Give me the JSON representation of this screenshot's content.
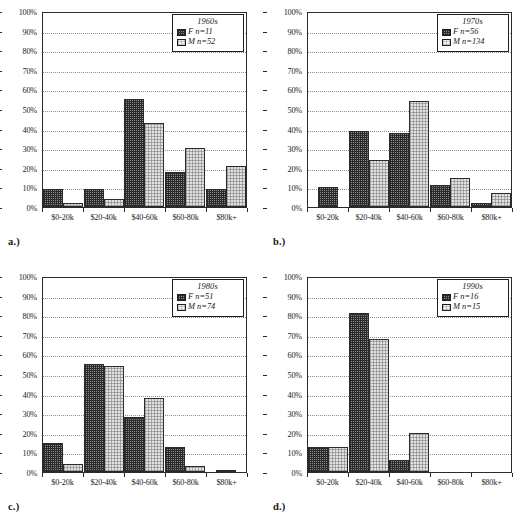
{
  "figure": {
    "panel_count": 4,
    "axis": {
      "y_ticks": [
        "100%",
        "90%",
        "80%",
        "70%",
        "60%",
        "50%",
        "40%",
        "30%",
        "20%",
        "10%",
        "0%"
      ],
      "y_min": 0,
      "y_max": 100,
      "y_step": 10,
      "categories": [
        "$0-20k",
        "$20-40k",
        "$40-60k",
        "$60-80k",
        "$80k+"
      ],
      "grid": true
    },
    "series_keys": [
      "F",
      "M"
    ],
    "colors": {
      "female_fill": "#8a8a8a",
      "male_fill": "#e2e2e2",
      "outline": "#2b2b2b",
      "gridline": "#8d8d8d",
      "background": "#ffffff"
    }
  },
  "panels": [
    {
      "caption": "a.)",
      "legend": {
        "title": "1960s",
        "female": "F n=11",
        "male": "M n=52"
      },
      "chart_data": {
        "type": "bar",
        "title": "1960s",
        "xlabel": "",
        "ylabel": "",
        "ylim": [
          0,
          100
        ],
        "grid": true,
        "legend_position": "top-right",
        "categories": [
          "$0-20k",
          "$20-40k",
          "$40-60k",
          "$60-80k",
          "$80k+"
        ],
        "series": [
          {
            "name": "F n=11",
            "values": [
              9,
              9,
              55,
              18,
              9
            ]
          },
          {
            "name": "M n=52",
            "values": [
              2,
              4,
              43,
              30,
              21
            ]
          }
        ]
      }
    },
    {
      "caption": "b.)",
      "legend": {
        "title": "1970s",
        "female": "F n=56",
        "male": "M n=134"
      },
      "chart_data": {
        "type": "bar",
        "title": "1970s",
        "xlabel": "",
        "ylabel": "",
        "ylim": [
          0,
          100
        ],
        "grid": true,
        "legend_position": "top-right",
        "categories": [
          "$0-20k",
          "$20-40k",
          "$40-60k",
          "$60-80k",
          "$80k+"
        ],
        "series": [
          {
            "name": "F n=56",
            "values": [
              10,
              39,
              38,
              11,
              2
            ]
          },
          {
            "name": "M n=134",
            "values": [
              0,
              24,
              54,
              15,
              7
            ]
          }
        ]
      }
    },
    {
      "caption": "c.)",
      "legend": {
        "title": "1980s",
        "female": "F n=51",
        "male": "M n=74"
      },
      "chart_data": {
        "type": "bar",
        "title": "1980s",
        "xlabel": "",
        "ylabel": "",
        "ylim": [
          0,
          100
        ],
        "grid": true,
        "legend_position": "top-right",
        "categories": [
          "$0-20k",
          "$20-40k",
          "$40-60k",
          "$60-80k",
          "$80k+"
        ],
        "series": [
          {
            "name": "F n=51",
            "values": [
              15,
              55,
              28,
              13,
              0
            ]
          },
          {
            "name": "M n=74",
            "values": [
              4,
              54,
              38,
              3,
              1
            ]
          }
        ]
      }
    },
    {
      "caption": "d.)",
      "legend": {
        "title": "1990s",
        "female": "F n=16",
        "male": "M n=15"
      },
      "chart_data": {
        "type": "bar",
        "title": "1990s",
        "xlabel": "",
        "ylabel": "",
        "ylim": [
          0,
          100
        ],
        "grid": true,
        "legend_position": "top-right",
        "categories": [
          "$0-20k",
          "$20-40k",
          "$40-60k",
          "$60-80k",
          "$80k+"
        ],
        "series": [
          {
            "name": "F n=16",
            "values": [
              13,
              81,
              6,
              0,
              0
            ]
          },
          {
            "name": "M n=15",
            "values": [
              13,
              68,
              20,
              0,
              0
            ]
          }
        ]
      }
    }
  ]
}
